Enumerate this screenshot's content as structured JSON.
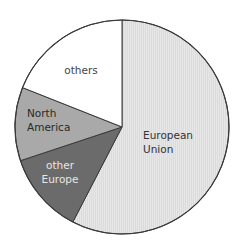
{
  "chart_data": {
    "type": "pie",
    "title": "",
    "start_angle_deg": 0,
    "direction": "clockwise",
    "categories": [
      "European Union",
      "other Europe",
      "North America",
      "others"
    ],
    "values": [
      57.6,
      12.3,
      11.1,
      19.0
    ],
    "unit": "percent (estimated from slice angles)",
    "legend": "none (labels inside slices)",
    "series": [
      {
        "name": "European Union",
        "label_lines": [
          "European",
          "Union"
        ],
        "value": 57.6,
        "color": "#e3e3e3",
        "text_color": "#333333",
        "label_pos": [
          143,
          139
        ],
        "anchor": "start"
      },
      {
        "name": "other Europe",
        "label_lines": [
          "other",
          "Europe"
        ],
        "value": 12.3,
        "color": "#6b6b6b",
        "text_color": "#e6e6e6",
        "label_pos": [
          60,
          169
        ],
        "anchor": "middle"
      },
      {
        "name": "North America",
        "label_lines": [
          "North",
          "America"
        ],
        "value": 11.1,
        "color": "#a9a9a9",
        "text_color": "#2a2a2a",
        "label_pos": [
          27,
          117
        ],
        "anchor": "start"
      },
      {
        "name": "others",
        "label_lines": [
          "others"
        ],
        "value": 19.0,
        "color": "#ffffff",
        "text_color": "#444444",
        "label_pos": [
          81,
          74
        ],
        "anchor": "middle"
      }
    ],
    "geometry": {
      "cx": 122,
      "cy": 127,
      "r": 107
    }
  }
}
